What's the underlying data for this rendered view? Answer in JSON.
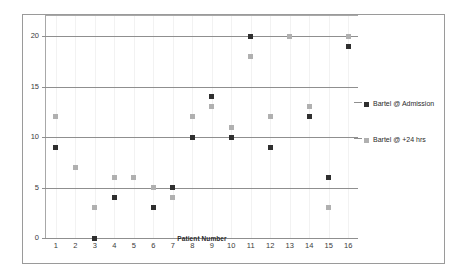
{
  "chart_data": {
    "type": "scatter",
    "title": "",
    "xlabel": "Patient Number",
    "ylabel": "",
    "categories": [
      "1",
      "2",
      "3",
      "4",
      "5",
      "6",
      "7",
      "8",
      "9",
      "10",
      "11",
      "12",
      "13",
      "14",
      "15",
      "16"
    ],
    "x": [
      1,
      2,
      3,
      4,
      5,
      6,
      7,
      8,
      9,
      10,
      11,
      12,
      13,
      14,
      15,
      16
    ],
    "series": [
      {
        "name": "Bartel @ Admission",
        "color": "#2f2f2f",
        "marker": "square",
        "values": [
          9,
          null,
          0,
          4,
          6,
          3,
          5,
          10,
          14,
          10,
          20,
          9,
          20,
          12,
          6,
          19
        ]
      },
      {
        "name": "Bartel @ +24 hrs",
        "color": "#b0b0b0",
        "marker": "square",
        "values": [
          12,
          7,
          3,
          6,
          6,
          5,
          4,
          12,
          13,
          11,
          18,
          12,
          20,
          13,
          3,
          20
        ]
      }
    ],
    "ylim": [
      0,
      22
    ],
    "yticks": [
      0,
      5,
      10,
      15,
      20
    ],
    "ytick_labels": [
      "0",
      "5",
      "10",
      "15",
      "20"
    ],
    "xtick_labels": [
      "1",
      "2",
      "3",
      "4",
      "5",
      "6",
      "7",
      "8",
      "9",
      "10",
      "11",
      "12",
      "13",
      "14",
      "15",
      "16"
    ],
    "grid": true,
    "legend_position": "right",
    "legend": [
      "Bartel @ Admission",
      "Bartel @ +24 hrs"
    ]
  },
  "legend": {
    "admission_label": "Bartel @ Admission",
    "hrs24_label": "Bartel @ +24 hrs"
  },
  "axes": {
    "x_title": "Patient Number"
  }
}
